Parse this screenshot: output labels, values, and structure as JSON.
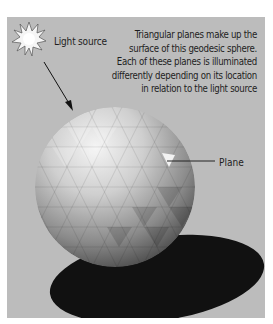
{
  "figure": {
    "light_source_label": "Light source",
    "plane_label": "Plane",
    "description": "Triangular planes make up the surface of this geodesic sphere. Each of these planes is illuminated differently depending on its location in relation to the light source",
    "colors": {
      "background": "#bcbcbc",
      "shadow": "#111111",
      "text": "#1e1e1e"
    }
  }
}
